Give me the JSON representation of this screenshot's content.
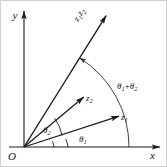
{
  "figure": {
    "type": "diagram",
    "background_color": "#ffffff",
    "stroke_color": "#1a1a1a",
    "frame": {
      "visible": true,
      "color": "#cfcfcf"
    },
    "axes": {
      "x_label": "x",
      "y_label": "y",
      "origin_label": "O",
      "x_arrow": true,
      "y_arrow": true
    },
    "vectors": [
      {
        "name": "z1",
        "label_main": "z",
        "label_sub": "1",
        "angle_deg": 18,
        "length": 100,
        "arrow": true
      },
      {
        "name": "z2",
        "label_main": "z",
        "label_sub": "2",
        "angle_deg": 40,
        "length": 78,
        "arrow": true
      },
      {
        "name": "z1z2",
        "label_main": "z",
        "label_sub": "1",
        "label_main2": "z",
        "label_sub2": "2",
        "angle_deg": 58,
        "length": 155,
        "arrow": true,
        "label_rotated": true
      }
    ],
    "angle_marks": [
      {
        "name": "theta1",
        "label_main": "θ",
        "label_sub": "1",
        "from_deg": 0,
        "to_deg": 18
      },
      {
        "name": "theta2",
        "label_main": "θ",
        "label_sub": "2",
        "from_deg": 18,
        "to_deg": 40
      }
    ],
    "sum_arc": {
      "name": "theta1-plus-theta2",
      "label_theta": "θ",
      "label_sub1": "1",
      "label_plus": "+",
      "label_sub2": "2",
      "from_deg": 0,
      "to_deg": 58,
      "radius": 105,
      "arrow_at_end": true
    }
  }
}
